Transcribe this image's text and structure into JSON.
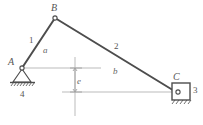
{
  "figure": {
    "background_color": "#ffffff",
    "line_color": "#4d4d4d",
    "centerline_color": "#a9a9a9"
  },
  "joints": [
    {
      "id": "A",
      "label": "A",
      "x": 22,
      "y": 68,
      "type": "fixed-pivot"
    },
    {
      "id": "B",
      "label": "B",
      "x": 55,
      "y": 18,
      "type": "pin-joint"
    },
    {
      "id": "C",
      "label": "C",
      "x": 176,
      "y": 92,
      "type": "slider-pin"
    }
  ],
  "links": [
    {
      "id": "1",
      "label": "1",
      "label_x": 29,
      "label_y": 36,
      "from": "A",
      "to": "B"
    },
    {
      "id": "2",
      "label": "2",
      "label_x": 114,
      "label_y": 42,
      "from": "B",
      "to": "C"
    }
  ],
  "dimensions": [
    {
      "id": "a",
      "label": "a",
      "label_x": 43,
      "label_y": 46
    },
    {
      "id": "b",
      "label": "b",
      "label_x": 113,
      "label_y": 67
    },
    {
      "id": "e",
      "label": "e",
      "label_x": 79,
      "label_y": 77
    }
  ],
  "bodies": [
    {
      "id": "4",
      "label": "4",
      "label_x": 21,
      "label_y": 94,
      "name": "ground-frame"
    },
    {
      "id": "3",
      "label": "3",
      "label_x": 192,
      "label_y": 88,
      "name": "slider-block"
    }
  ]
}
